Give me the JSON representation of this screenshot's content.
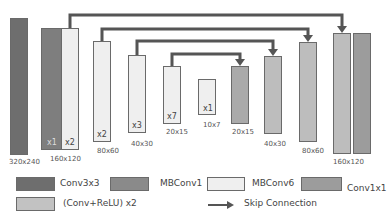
{
  "colors": {
    "conv3x3": "#6e6e6e",
    "mbconv1": "#8a8a8a",
    "mbconv6": "#efefef",
    "conv1x1": "#9c9c9c",
    "conv_relu": "#c2c2c2",
    "skip": "#555555"
  },
  "encoder": [
    {
      "type": "Conv3x3",
      "size": "320x240"
    },
    {
      "type": "MBConv1",
      "repeat": "x1"
    },
    {
      "type": "MBConv6",
      "repeat": "x2",
      "size": "160x120"
    },
    {
      "type": "MBConv6",
      "repeat": "x2",
      "size": "80x60"
    },
    {
      "type": "MBConv6",
      "repeat": "x3",
      "size": "40x30"
    },
    {
      "type": "MBConv6",
      "repeat": "x7",
      "size": "20x15"
    },
    {
      "type": "MBConv6",
      "repeat": "x1",
      "size": "10x7"
    }
  ],
  "decoder": [
    {
      "type": "(Conv+ReLU) x2",
      "size": "20x15"
    },
    {
      "type": "(Conv+ReLU) x2",
      "size": "40x30"
    },
    {
      "type": "(Conv+ReLU) x2",
      "size": "80x60"
    },
    {
      "type": "(Conv+ReLU) x2",
      "size": "160x120"
    },
    {
      "type": "Conv1x1"
    }
  ],
  "legend": {
    "conv3x3": "Conv3x3",
    "mbconv1": "MBConv1",
    "mbconv6": "MBConv6",
    "conv1x1": "Conv1x1",
    "conv_relu": "(Conv+ReLU) x2",
    "skip": "Skip Connection"
  }
}
